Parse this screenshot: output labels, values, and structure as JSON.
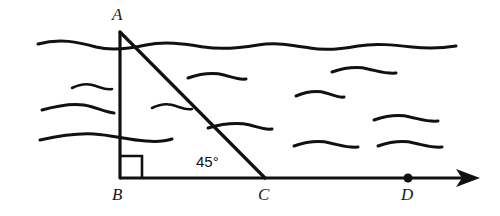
{
  "figure": {
    "type": "geometry-diagram",
    "stroke_color": "#111111",
    "background_color": "#ffffff",
    "labels": {
      "a": "A",
      "b": "B",
      "c": "C",
      "d": "D",
      "angle": "45°"
    },
    "points": {
      "A": {
        "x": 120,
        "y": 32
      },
      "B": {
        "x": 120,
        "y": 178
      },
      "C": {
        "x": 265,
        "y": 178
      },
      "D": {
        "x": 408,
        "y": 178
      }
    },
    "segments": [
      {
        "name": "AB",
        "x1": 120,
        "y1": 32,
        "x2": 120,
        "y2": 178
      },
      {
        "name": "AC",
        "x1": 120,
        "y1": 32,
        "x2": 265,
        "y2": 178
      },
      {
        "name": "BD-ray",
        "x1": 120,
        "y1": 178,
        "x2": 472,
        "y2": 178
      }
    ],
    "right_angle": {
      "vertex": "B",
      "size": 22
    },
    "angle_at_C": {
      "value": 45,
      "unit": "degrees"
    },
    "arrow": {
      "tip_x": 480,
      "y": 178
    },
    "point_marker_D": {
      "x": 408,
      "y": 178,
      "radius": 4.5
    },
    "waves": {
      "surface_path": "M 38,44 C 60,38 78,42 96,47 C 112,51 128,49 146,45 C 166,41 184,44 204,47 C 222,50 240,48 258,45 C 276,42 292,45 310,48 C 326,51 342,49 358,46 C 376,43 394,45 412,47 C 430,49 444,48 456,46",
      "strokes": [
        "M 40,140 C 58,136 76,133 94,134 C 112,135 128,140 146,141 C 158,142 166,141 172,139",
        "M 42,110 C 56,106 70,103 84,105 C 96,107 104,112 114,113",
        "M 72,88 C 80,84 88,83 96,86 C 102,88 106,90 112,89",
        "M 152,108 C 160,104 168,103 176,106 C 182,108 186,110 192,109",
        "M 188,78 C 200,74 212,72 224,75 C 232,77 238,80 246,79",
        "M 208,128 C 222,124 236,122 250,125 C 258,127 264,130 272,129",
        "M 296,96 C 306,92 316,90 326,93 C 334,95 338,98 344,97",
        "M 294,146 C 306,142 318,140 330,143 C 340,145 348,148 358,147",
        "M 332,72 C 344,68 356,66 368,69 C 378,71 386,74 396,73",
        "M 374,120 C 386,116 398,114 410,117 C 420,119 428,122 438,121",
        "M 378,146 C 390,142 402,140 414,143 C 424,145 432,148 442,147"
      ]
    }
  }
}
